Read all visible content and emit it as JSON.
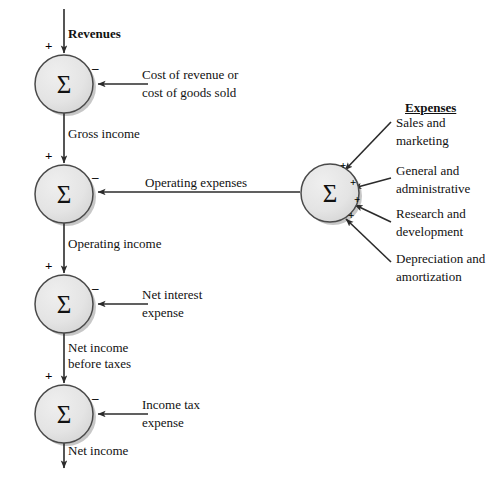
{
  "diagram": {
    "title_revenues": "Revenues",
    "title_expenses": "Expenses",
    "node_symbol": "Σ",
    "signs": {
      "plus": "+",
      "minus": "–"
    },
    "nodes": [
      {
        "id": "gross-income-node",
        "symbol": "Σ",
        "cx": 64,
        "cy": 84,
        "r": 29
      },
      {
        "id": "operating-income-node",
        "symbol": "Σ",
        "cx": 64,
        "cy": 194,
        "r": 29
      },
      {
        "id": "pretax-income-node",
        "symbol": "Σ",
        "cx": 64,
        "cy": 304,
        "r": 29
      },
      {
        "id": "net-income-node",
        "symbol": "Σ",
        "cx": 64,
        "cy": 414,
        "r": 29
      },
      {
        "id": "total-expenses-node",
        "symbol": "Σ",
        "cx": 330,
        "cy": 193,
        "r": 29
      }
    ],
    "flow_labels": [
      {
        "id": "revenues",
        "text": "Revenues",
        "bold": true
      },
      {
        "id": "gross-income",
        "text": "Gross income"
      },
      {
        "id": "operating-income",
        "text": "Operating income"
      },
      {
        "id": "net-income-before-taxes-line1",
        "text": "Net income"
      },
      {
        "id": "net-income-before-taxes-line2",
        "text": "before taxes"
      },
      {
        "id": "net-income",
        "text": "Net income"
      }
    ],
    "deduction_labels": [
      {
        "id": "cost-of-revenue-line1",
        "text": "Cost of revenue or"
      },
      {
        "id": "cost-of-revenue-line2",
        "text": "cost of goods sold"
      },
      {
        "id": "operating-expenses",
        "text": "Operating expenses"
      },
      {
        "id": "net-interest-expense-line1",
        "text": "Net interest"
      },
      {
        "id": "net-interest-expense-line2",
        "text": "expense"
      },
      {
        "id": "income-tax-expense-line1",
        "text": "Income tax"
      },
      {
        "id": "income-tax-expense-line2",
        "text": "expense"
      }
    ],
    "expense_items": [
      {
        "id": "sales-and-marketing",
        "line1": "Sales and",
        "line2": "marketing"
      },
      {
        "id": "general-and-administrative",
        "line1": "General and",
        "line2": "administrative"
      },
      {
        "id": "research-and-development",
        "line1": "Research and",
        "line2": "development"
      },
      {
        "id": "depreciation-and-amortization",
        "line1": "Depreciation and",
        "line2": "amortization"
      }
    ],
    "colors": {
      "node_fill": "#e3e3e3",
      "node_stroke": "#555555",
      "line": "#2b2b2b",
      "text": "#111111",
      "shadow": "#b9b9b9"
    }
  }
}
